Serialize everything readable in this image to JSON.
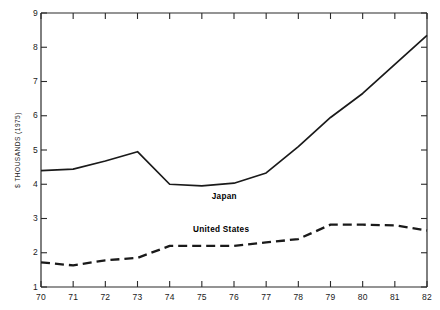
{
  "chart_data": {
    "type": "line",
    "title": "",
    "subtitle": "",
    "xlabel": "",
    "ylabel": "$ THOUSANDS (1975)",
    "x": [
      70,
      71,
      72,
      73,
      74,
      75,
      76,
      77,
      78,
      79,
      80,
      81,
      82
    ],
    "xtick_labels": [
      "70",
      "71",
      "72",
      "73",
      "74",
      "75",
      "76",
      "77",
      "78",
      "79",
      "80",
      "81",
      "82"
    ],
    "ytick_labels": [
      "1",
      "2",
      "3",
      "4",
      "5",
      "6",
      "7",
      "8",
      "9"
    ],
    "ytick_values": [
      1,
      2,
      3,
      4,
      5,
      6,
      7,
      8,
      9
    ],
    "xlim": [
      70,
      82
    ],
    "ylim": [
      1,
      9
    ],
    "grid": false,
    "legend_position": "inline-annotation",
    "series": [
      {
        "name": "Japan",
        "style": "solid",
        "color": "#1a1a1a",
        "values": [
          4.4,
          4.44,
          4.68,
          4.95,
          4.0,
          3.95,
          4.03,
          4.33,
          5.1,
          5.95,
          6.65,
          7.5,
          8.35
        ],
        "annotation": "Japan",
        "annotation_x": 75.7,
        "annotation_y": 3.58
      },
      {
        "name": "United States",
        "style": "dashed",
        "color": "#1a1a1a",
        "values": [
          1.72,
          1.63,
          1.78,
          1.85,
          2.2,
          2.2,
          2.2,
          2.3,
          2.4,
          2.82,
          2.82,
          2.8,
          2.65
        ],
        "annotation": "United States",
        "annotation_x": 75.6,
        "annotation_y": 2.62
      }
    ]
  },
  "axes": {
    "y_axis_name": "y-axis",
    "x_axis_name": "x-axis"
  }
}
